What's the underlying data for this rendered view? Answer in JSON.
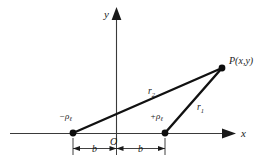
{
  "figure": {
    "background_color": "#ffffff",
    "line_color": "#111111",
    "axis_color": "#3a3a3a",
    "text_color": "#1a1a1a"
  },
  "axes": {
    "y_label": "y",
    "x_label": "x",
    "origin_label": "O"
  },
  "points": {
    "field_point_label": "P(x,y)",
    "field_point_x": 222,
    "field_point_y": 68,
    "negative_charge": {
      "sign": "−",
      "symbol": "ρ",
      "subscript": "ℓ",
      "x": 73,
      "y": 133
    },
    "positive_charge": {
      "sign": "+",
      "symbol": "ρ",
      "subscript": "ℓ",
      "x": 165,
      "y": 133
    }
  },
  "distances": {
    "r2_symbol": "r",
    "r2_subscript": "2",
    "r1_symbol": "r",
    "r1_subscript": "1"
  },
  "dimensions": {
    "left_span_label": "b",
    "right_span_label": "b",
    "total_separation": "2b"
  }
}
